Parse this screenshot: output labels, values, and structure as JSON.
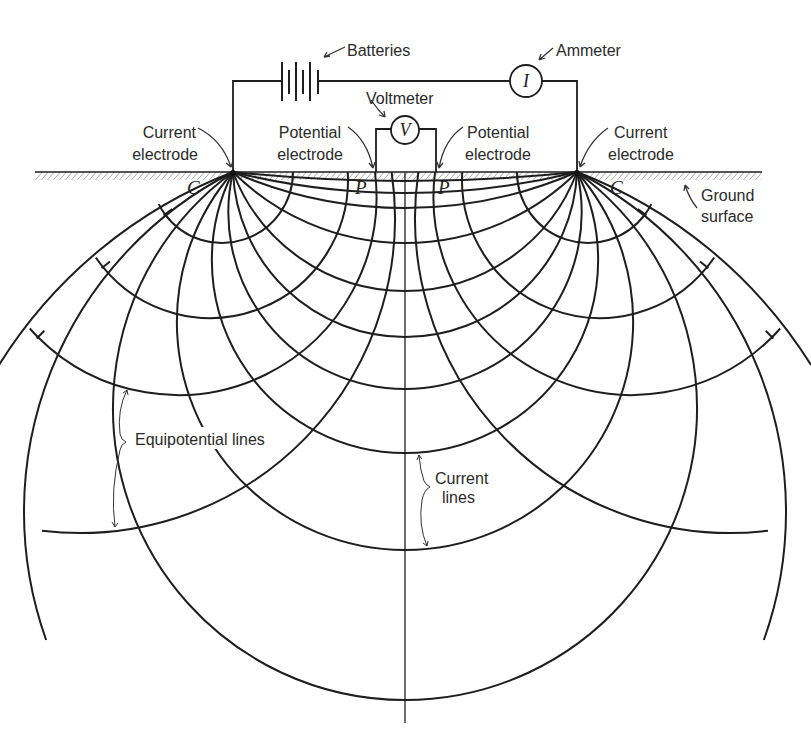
{
  "labels": {
    "batteries": "Batteries",
    "ammeter": "Ammeter",
    "ammeter_symbol": "I",
    "voltmeter": "Voltmeter",
    "voltmeter_symbol": "V",
    "current_electrode_left": [
      "Current",
      "electrode"
    ],
    "potential_electrode_left": [
      "Potential",
      "electrode"
    ],
    "potential_electrode_right": [
      "Potential",
      "electrode"
    ],
    "current_electrode_right": [
      "Current",
      "electrode"
    ],
    "ground_surface": [
      "Ground",
      "surface"
    ],
    "electrode_c_left": "C",
    "electrode_p_left": "P",
    "electrode_p_right": "P",
    "electrode_c_right": "C",
    "equipotential_lines": "Equipotential lines",
    "current_lines": [
      "Current",
      "lines"
    ]
  },
  "geometry": {
    "ground_y": 172,
    "ground_x": [
      35,
      762
    ],
    "current_electrodes_x": [
      233,
      577
    ],
    "potential_electrodes_x": [
      376,
      436
    ],
    "center_x": 405,
    "center_line_bottom_y": 723,
    "current_line_bottoms_y": [
      181,
      193,
      208,
      243,
      291,
      337,
      389,
      453,
      550,
      700
    ],
    "current_line_partial": [
      {
        "bottom_y": 893,
        "end_y": 640
      },
      {
        "bottom_y": 1098,
        "end_y": 365
      }
    ],
    "equipotential_arcs_left": [
      {
        "cx": 222,
        "cy": 172,
        "r": 71,
        "left_end_x": 165,
        "tick": true
      },
      {
        "cx": 210,
        "cy": 180,
        "r": 138,
        "left_end_x": 103,
        "tick": true
      },
      {
        "cx": 178,
        "cy": 196.5,
        "r": 198.5,
        "left_end_x": 38,
        "tick": true
      },
      {
        "cx": 80,
        "cy": 218,
        "r": 315,
        "left_end_x": 42,
        "tick": false
      }
    ]
  },
  "colors": {
    "ink": "#1e1e1e",
    "background": "#ffffff"
  }
}
